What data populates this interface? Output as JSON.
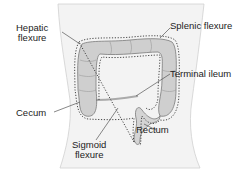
{
  "diagram": {
    "labels": {
      "hepatic_flexure": [
        "Hepatic",
        "flexure"
      ],
      "splenic_flexure": "Splenic flexure",
      "terminal_ileum": "Terminal ileum",
      "cecum": "Cecum",
      "sigmoid_flexure": [
        "Sigmoid",
        "flexure"
      ],
      "rectum": "Rectum"
    },
    "colors": {
      "torso_fill": "#f3f3f3",
      "torso_outline": "#c8c8c8",
      "colon_fill": "#c9c9c9",
      "colon_outline": "#7a7a7a",
      "dotted_outline": "#333333",
      "leader_line": "#555555",
      "text": "#222222"
    }
  }
}
